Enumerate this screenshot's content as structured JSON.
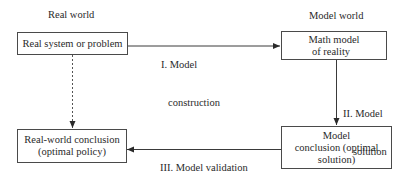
{
  "diagram": {
    "type": "flowchart",
    "columns": {
      "left_header": "Real world",
      "right_header": "Model world"
    },
    "nodes": [
      {
        "id": "real-system",
        "lines": [
          "Real system or problem"
        ]
      },
      {
        "id": "math-model",
        "lines": [
          "Math model",
          "of reality"
        ]
      },
      {
        "id": "model-conclusion",
        "lines": [
          "Model",
          "conclusion (optimal",
          "solution)"
        ]
      },
      {
        "id": "real-world-conclusion",
        "lines": [
          "Real-world conclusion",
          "(optimal policy)"
        ]
      }
    ],
    "edges": [
      {
        "from": "real-system",
        "to": "math-model",
        "style": "solid",
        "lines": [
          "I. Model",
          "construction"
        ]
      },
      {
        "from": "math-model",
        "to": "model-conclusion",
        "style": "solid",
        "lines": [
          "II. Model",
          "solution"
        ]
      },
      {
        "from": "model-conclusion",
        "to": "real-world-conclusion",
        "style": "solid",
        "lines": [
          "III. Model validation",
          "and interpretation"
        ]
      },
      {
        "from": "real-system",
        "to": "real-world-conclusion",
        "style": "dashed",
        "lines": []
      }
    ],
    "colors": {
      "line": "#3a3a3a",
      "text": "#2a2a2a",
      "background": "#ffffff"
    }
  }
}
